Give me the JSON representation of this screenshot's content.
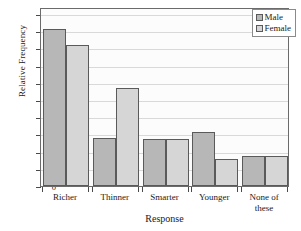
{
  "chart_data": {
    "type": "bar",
    "title": "",
    "xlabel": "Response",
    "ylabel": "Relative Frequency",
    "categories": [
      "Richer",
      "Thinner",
      "Smarter",
      "Younger",
      "None of\nthese"
    ],
    "series": [
      {
        "name": "Male",
        "color": "#b7b7b7",
        "values": [
          0.455,
          0.139,
          0.138,
          0.157,
          0.088
        ]
      },
      {
        "name": "Female",
        "color": "#d6d6d6",
        "values": [
          0.409,
          0.285,
          0.138,
          0.078,
          0.088
        ]
      }
    ],
    "ylim": [
      0,
      0.52
    ],
    "yticks": [
      0,
      0.05,
      0.1,
      0.15,
      0.2,
      0.25,
      0.3,
      0.35,
      0.4,
      0.45,
      0.5
    ],
    "ytick_labels": [
      "0",
      "0.05",
      "0.10",
      "0.15",
      "0.20",
      "0.25",
      "0.30",
      "0.35",
      "0.40",
      "0.45",
      "0.50"
    ],
    "grid": true,
    "grid_axis": "y",
    "legend_position": "upper-right",
    "bar_edge_color": "#5a5a5a",
    "frame_color": "#6b6b6b"
  }
}
